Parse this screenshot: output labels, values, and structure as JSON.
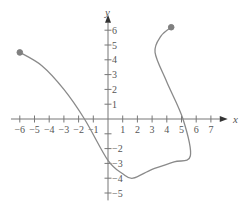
{
  "chart_data": {
    "type": "line",
    "title": "",
    "xlabel": "x",
    "ylabel": "y",
    "xlim": [
      -6,
      7
    ],
    "ylim": [
      -5,
      6
    ],
    "x_ticks": [
      -6,
      -5,
      -4,
      -3,
      -2,
      -1,
      1,
      2,
      3,
      4,
      5,
      6,
      7
    ],
    "y_ticks": [
      6,
      5,
      4,
      3,
      2,
      1,
      -2,
      -3,
      -4,
      -5
    ],
    "x_tick_labels": [
      "−6",
      "−5",
      "−4",
      "−3",
      "−2",
      "−1",
      "1",
      "2",
      "3",
      "4",
      "5",
      "6",
      "7"
    ],
    "y_tick_labels": [
      "6",
      "5",
      "4",
      "3",
      "2",
      "1",
      "−2",
      "−3",
      "−4",
      "−5"
    ],
    "grid": false,
    "legend": null,
    "series": [
      {
        "name": "curve",
        "color": "#8a8a8a",
        "points": [
          {
            "x": -6.0,
            "y": 4.5
          },
          {
            "x": -4.5,
            "y": 3.6
          },
          {
            "x": -3.0,
            "y": 2.0
          },
          {
            "x": -1.6,
            "y": 0.0
          },
          {
            "x": 0.0,
            "y": -2.8
          },
          {
            "x": 1.0,
            "y": -3.7
          },
          {
            "x": 1.7,
            "y": -4.0
          },
          {
            "x": 3.0,
            "y": -3.4
          },
          {
            "x": 4.5,
            "y": -2.9
          },
          {
            "x": 5.6,
            "y": -2.5
          },
          {
            "x": 5.1,
            "y": 0.0
          },
          {
            "x": 4.0,
            "y": 2.5
          },
          {
            "x": 3.2,
            "y": 4.5
          },
          {
            "x": 3.6,
            "y": 5.6
          },
          {
            "x": 4.3,
            "y": 6.2
          }
        ],
        "endpoints": [
          {
            "x": -6.0,
            "y": 4.5,
            "filled": true
          },
          {
            "x": 4.3,
            "y": 6.2,
            "filled": true
          }
        ]
      }
    ]
  },
  "axes": {
    "x_name": "x",
    "y_name": "y"
  }
}
